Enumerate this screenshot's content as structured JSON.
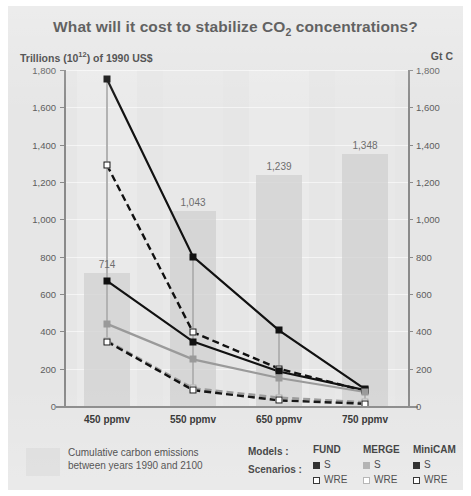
{
  "title_main": "What will it cost to stabilize CO",
  "title_sub": "2",
  "title_tail": " concentrations?",
  "axis_caption_left_a": "Trillions (10",
  "axis_caption_left_sup": "12",
  "axis_caption_left_b": ") of 1990 US$",
  "axis_caption_right": "Gt C",
  "legend": {
    "swatch_caption_line1": "Cumulative carbon emissions",
    "swatch_caption_line2": "between years 1990 and 2100",
    "models_label": "Models :",
    "scenarios_label": "Scenarios :",
    "models": [
      {
        "name": "FUND",
        "s_label": "S",
        "wre_label": "WRE",
        "color": "#111111"
      },
      {
        "name": "MERGE",
        "s_label": "S",
        "wre_label": "WRE",
        "color": "#a8a8a8"
      },
      {
        "name": "MiniCAM",
        "s_label": "S",
        "wre_label": "WRE",
        "color": "#111111"
      }
    ]
  },
  "chart_data": {
    "type": "line",
    "title": "What will it cost to stabilize CO2 concentrations?",
    "xlabel": "",
    "ylabel": "Trillions (10^12) of 1990 US$",
    "y2label": "Gt C",
    "ylim": [
      0,
      1800
    ],
    "y2lim": [
      0,
      1800
    ],
    "grid": true,
    "legend_position": "bottom-right",
    "categories": [
      "450 ppmv",
      "550 ppmv",
      "650 ppmv",
      "750 ppmv"
    ],
    "ytick_labels": [
      "0",
      "200",
      "400",
      "600",
      "800",
      "1,000",
      "1,200",
      "1,400",
      "1,600",
      "1,800"
    ],
    "ytick_values": [
      0,
      200,
      400,
      600,
      800,
      1000,
      1200,
      1400,
      1600,
      1800
    ],
    "y2tick_labels": [
      "0",
      "200",
      "400",
      "600",
      "800",
      "1,000",
      "1,200",
      "1,400",
      "1,600",
      "1,800"
    ],
    "y2tick_values": [
      0,
      200,
      400,
      600,
      800,
      1000,
      1200,
      1400,
      1600,
      1800
    ],
    "emission_bars": {
      "name": "Cumulative carbon emissions between years 1990 and 2100",
      "unit": "Gt C",
      "values": [
        714,
        1043,
        1239,
        1348
      ],
      "labels": [
        "714",
        "1,043",
        "1,239",
        "1,348"
      ],
      "color": "#d0d0d0"
    },
    "series": [
      {
        "name": "FUND S",
        "model": "FUND",
        "scenario": "S",
        "marker": "filled-square",
        "line": "solid",
        "color": "#111111",
        "values": [
          1750,
          800,
          405,
          90
        ]
      },
      {
        "name": "FUND WRE",
        "model": "FUND",
        "scenario": "WRE",
        "marker": "open-square",
        "line": "dashed",
        "color": "#111111",
        "values": [
          1290,
          395,
          200,
          80
        ]
      },
      {
        "name": "MiniCAM S",
        "model": "MiniCAM",
        "scenario": "S",
        "marker": "filled-square",
        "line": "solid",
        "color": "#111111",
        "values": [
          670,
          345,
          185,
          85
        ]
      },
      {
        "name": "MERGE S",
        "model": "MERGE",
        "scenario": "S",
        "marker": "filled-square",
        "line": "solid",
        "color": "#9a9a9a",
        "values": [
          440,
          250,
          150,
          75
        ]
      },
      {
        "name": "MERGE WRE",
        "model": "MERGE",
        "scenario": "WRE",
        "marker": "open-square",
        "line": "dashed",
        "color": "#9a9a9a",
        "values": [
          350,
          95,
          45,
          20
        ]
      },
      {
        "name": "MiniCAM WRE",
        "model": "MiniCAM",
        "scenario": "WRE",
        "marker": "open-square",
        "line": "dashed",
        "color": "#111111",
        "values": [
          345,
          85,
          30,
          12
        ]
      }
    ]
  }
}
